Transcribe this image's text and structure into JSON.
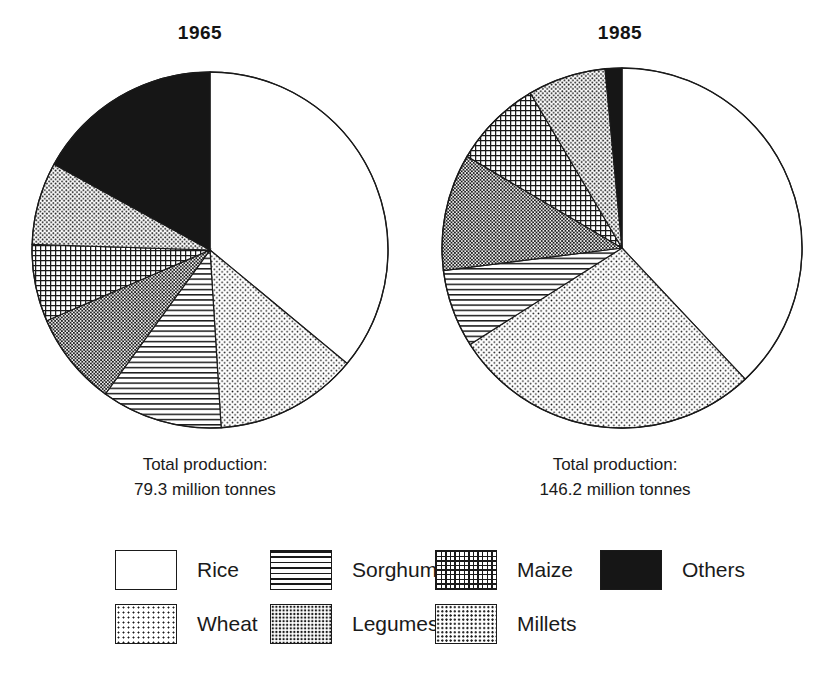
{
  "figure": {
    "background": "#ffffff",
    "ink": "#1a1a1a"
  },
  "panels": [
    {
      "id": "panel-1965",
      "title": "1965",
      "caption_line1": "Total production:",
      "caption_line2": "79.3 million tonnes"
    },
    {
      "id": "panel-1985",
      "title": "1985",
      "caption_line1": "Total production:",
      "caption_line2": "146.2 million  tonnes"
    }
  ],
  "legend": {
    "position": "bottom",
    "rows": [
      [
        {
          "label": "Rice",
          "pattern": "blank",
          "swatch": "rice-swatch"
        },
        {
          "label": "Sorghum",
          "pattern": "hlines",
          "swatch": "sorghum-swatch"
        },
        {
          "label": "Maize",
          "pattern": "grid",
          "swatch": "maize-swatch"
        },
        {
          "label": "Others",
          "pattern": "solid",
          "swatch": "others-swatch"
        }
      ],
      [
        {
          "label": "Wheat",
          "pattern": "dots",
          "swatch": "wheat-swatch"
        },
        {
          "label": "Legumes",
          "pattern": "dense",
          "swatch": "legumes-swatch"
        },
        {
          "label": "Millets",
          "pattern": "medium",
          "swatch": "millets-swatch"
        }
      ]
    ]
  },
  "chart_data": [
    {
      "type": "pie",
      "title": "1965",
      "subtitle": "Total production: 79.3 million tonnes",
      "total": 79.3,
      "total_units": "million tonnes",
      "start_angle_deg": 0,
      "direction": "clockwise",
      "categories": [
        "Rice",
        "Wheat",
        "Sorghum",
        "Legumes",
        "Maize",
        "Millets",
        "Others"
      ],
      "values": [
        36.0,
        13.0,
        11.0,
        8.5,
        7.0,
        7.5,
        17.0
      ],
      "value_units": "percent",
      "patterns": [
        "blank",
        "dots",
        "hlines",
        "dense",
        "grid",
        "medium",
        "solid"
      ],
      "legend_position": "bottom",
      "grid": false
    },
    {
      "type": "pie",
      "title": "1985",
      "subtitle": "Total production: 146.2 million tonnes",
      "total": 146.2,
      "total_units": "million tonnes",
      "start_angle_deg": 0,
      "direction": "clockwise",
      "categories": [
        "Rice",
        "Wheat",
        "Sorghum",
        "Legumes",
        "Maize",
        "Millets",
        "Others"
      ],
      "values": [
        38.0,
        28.0,
        7.0,
        10.5,
        8.0,
        7.0,
        1.5
      ],
      "value_units": "percent",
      "patterns": [
        "blank",
        "dots",
        "hlines",
        "dense",
        "grid",
        "medium",
        "solid"
      ],
      "legend_position": "bottom",
      "grid": false
    }
  ]
}
